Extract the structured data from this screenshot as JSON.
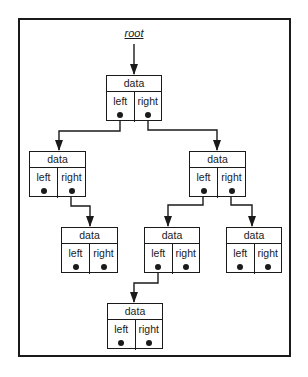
{
  "diagram": {
    "type": "binary-tree-linked-structure",
    "root_label": "root",
    "node_fields": {
      "data_label": "data",
      "left_label": "left",
      "right_label": "right"
    },
    "nodes": [
      {
        "id": "n1",
        "data": "data",
        "left": "left",
        "right": "right",
        "x": 106,
        "y": 75,
        "w": 56,
        "h": 46
      },
      {
        "id": "n2",
        "data": "data",
        "left": "left",
        "right": "right",
        "x": 29,
        "y": 151,
        "w": 57,
        "h": 46
      },
      {
        "id": "n3",
        "data": "data",
        "left": "left",
        "right": "right",
        "x": 189,
        "y": 151,
        "w": 57,
        "h": 46
      },
      {
        "id": "n4",
        "data": "data",
        "left": "left",
        "right": "right",
        "x": 61,
        "y": 227,
        "w": 57,
        "h": 46
      },
      {
        "id": "n5",
        "data": "data",
        "left": "left",
        "right": "right",
        "x": 144,
        "y": 227,
        "w": 56,
        "h": 46
      },
      {
        "id": "n6",
        "data": "data",
        "left": "left",
        "right": "right",
        "x": 226,
        "y": 227,
        "w": 56,
        "h": 46
      },
      {
        "id": "n7",
        "data": "data",
        "left": "left",
        "right": "right",
        "x": 107,
        "y": 303,
        "w": 56,
        "h": 46
      }
    ],
    "edges": [
      {
        "from": "root",
        "to": "n1",
        "via": "label"
      },
      {
        "from": "n1",
        "pointer": "left",
        "to": "n2"
      },
      {
        "from": "n1",
        "pointer": "right",
        "to": "n3"
      },
      {
        "from": "n2",
        "pointer": "right",
        "to": "n4"
      },
      {
        "from": "n3",
        "pointer": "left",
        "to": "n5"
      },
      {
        "from": "n3",
        "pointer": "right",
        "to": "n6"
      },
      {
        "from": "n5",
        "pointer": "left",
        "to": "n7"
      }
    ],
    "null_pointers": [
      {
        "node": "n2",
        "pointer": "left"
      },
      {
        "node": "n4",
        "pointer": "left"
      },
      {
        "node": "n4",
        "pointer": "right"
      },
      {
        "node": "n5",
        "pointer": "right"
      },
      {
        "node": "n6",
        "pointer": "left"
      },
      {
        "node": "n6",
        "pointer": "right"
      },
      {
        "node": "n7",
        "pointer": "left"
      },
      {
        "node": "n7",
        "pointer": "right"
      }
    ],
    "colors": {
      "stroke": "#1a1a1a",
      "background": "#ffffff"
    }
  }
}
